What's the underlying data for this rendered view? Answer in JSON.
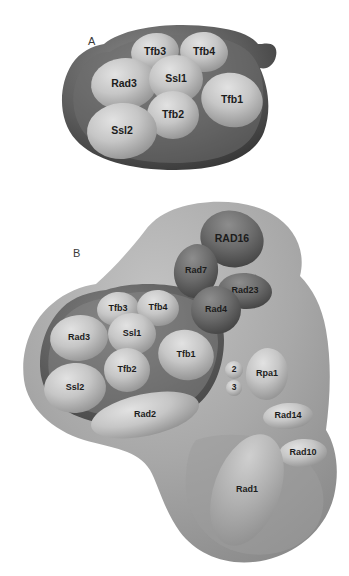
{
  "figure": {
    "background_color": "#ffffff",
    "panels": [
      {
        "id": "A",
        "label": "A",
        "label_x": 88,
        "label_y": 41,
        "envelope": {
          "name": "tfiih-core-envelope",
          "fill_light": "#b9b9b9",
          "fill_dark": "#4a4a4a",
          "rim_color": "#2e2e2e"
        },
        "subunits": [
          {
            "id": "tfb3",
            "label": "Tfb3",
            "cx": 155,
            "cy": 52,
            "rx": 24,
            "ry": 19,
            "rot": -8,
            "tone": "light",
            "size": "normal"
          },
          {
            "id": "tfb4",
            "label": "Tfb4",
            "cx": 204,
            "cy": 52,
            "rx": 24,
            "ry": 20,
            "rot": 6,
            "tone": "light",
            "size": "normal"
          },
          {
            "id": "rad3",
            "label": "Rad3",
            "cx": 124,
            "cy": 84,
            "rx": 33,
            "ry": 26,
            "rot": -6,
            "tone": "light",
            "size": "normal"
          },
          {
            "id": "ssl1",
            "label": "Ssl1",
            "cx": 176,
            "cy": 79,
            "rx": 27,
            "ry": 24,
            "rot": 0,
            "tone": "light",
            "size": "normal"
          },
          {
            "id": "tfb1",
            "label": "Tfb1",
            "cx": 232,
            "cy": 100,
            "rx": 31,
            "ry": 27,
            "rot": 16,
            "tone": "light",
            "size": "normal"
          },
          {
            "id": "tfb2",
            "label": "Tfb2",
            "cx": 173,
            "cy": 115,
            "rx": 26,
            "ry": 24,
            "rot": 0,
            "tone": "light",
            "size": "normal"
          },
          {
            "id": "ssl2",
            "label": "Ssl2",
            "cx": 122,
            "cy": 131,
            "rx": 35,
            "ry": 28,
            "rot": -4,
            "tone": "light",
            "size": "normal"
          }
        ]
      },
      {
        "id": "B",
        "label": "B",
        "label_x": 73,
        "label_y": 253,
        "envelope": {
          "name": "repairosome-envelope",
          "fill_light": "#b2b2b2",
          "fill_mid": "#9e9e9e",
          "fill_dark": "#5a5a5a",
          "rim_color": "#8e8e8e"
        },
        "subunits": [
          {
            "id": "rad16",
            "label": "RAD16",
            "cx": 232,
            "cy": 239,
            "rx": 32,
            "ry": 28,
            "rot": 18,
            "tone": "dark",
            "size": "normal"
          },
          {
            "id": "rad7",
            "label": "Rad7",
            "cx": 196,
            "cy": 271,
            "rx": 22,
            "ry": 27,
            "rot": 8,
            "tone": "dark",
            "size": "small"
          },
          {
            "id": "rad23",
            "label": "Rad23",
            "cx": 245,
            "cy": 291,
            "rx": 27,
            "ry": 18,
            "rot": 4,
            "tone": "dark",
            "size": "small"
          },
          {
            "id": "rad4",
            "label": "Rad4",
            "cx": 216,
            "cy": 310,
            "rx": 25,
            "ry": 24,
            "rot": 0,
            "tone": "dark",
            "size": "small"
          },
          {
            "id": "tfb3",
            "label": "Tfb3",
            "cx": 118,
            "cy": 309,
            "rx": 21,
            "ry": 17,
            "rot": -6,
            "tone": "light",
            "size": "small"
          },
          {
            "id": "tfb4",
            "label": "Tfb4",
            "cx": 158,
            "cy": 308,
            "rx": 21,
            "ry": 18,
            "rot": 5,
            "tone": "light",
            "size": "small"
          },
          {
            "id": "rad3",
            "label": "Rad3",
            "cx": 79,
            "cy": 338,
            "rx": 29,
            "ry": 23,
            "rot": -6,
            "tone": "light",
            "size": "small"
          },
          {
            "id": "ssl1",
            "label": "Ssl1",
            "cx": 132,
            "cy": 334,
            "rx": 24,
            "ry": 21,
            "rot": 0,
            "tone": "light",
            "size": "small"
          },
          {
            "id": "tfb1",
            "label": "Tfb1",
            "cx": 186,
            "cy": 355,
            "rx": 28,
            "ry": 25,
            "rot": 14,
            "tone": "light",
            "size": "small"
          },
          {
            "id": "tfb2",
            "label": "Tfb2",
            "cx": 127,
            "cy": 370,
            "rx": 23,
            "ry": 22,
            "rot": 0,
            "tone": "light",
            "size": "small"
          },
          {
            "id": "ssl2",
            "label": "Ssl2",
            "cx": 75,
            "cy": 388,
            "rx": 31,
            "ry": 25,
            "rot": -4,
            "tone": "light",
            "size": "small"
          },
          {
            "id": "rpa2",
            "label": "2",
            "cx": 234,
            "cy": 370,
            "rx": 9,
            "ry": 9,
            "rot": 0,
            "tone": "light",
            "size": "tiny"
          },
          {
            "id": "rpa3",
            "label": "3",
            "cx": 234,
            "cy": 388,
            "rx": 8,
            "ry": 8,
            "rot": 0,
            "tone": "light",
            "size": "tiny"
          },
          {
            "id": "rpa1",
            "label": "Rpa1",
            "cx": 267,
            "cy": 374,
            "rx": 21,
            "ry": 26,
            "rot": 6,
            "tone": "light",
            "size": "small"
          },
          {
            "id": "rad2",
            "label": "Rad2",
            "cx": 145,
            "cy": 415,
            "rx": 55,
            "ry": 21,
            "rot": -12,
            "tone": "light",
            "size": "small"
          },
          {
            "id": "rad14",
            "label": "Rad14",
            "cx": 288,
            "cy": 416,
            "rx": 25,
            "ry": 13,
            "rot": -4,
            "tone": "light",
            "size": "small"
          },
          {
            "id": "rad10",
            "label": "Rad10",
            "cx": 303,
            "cy": 453,
            "rx": 24,
            "ry": 14,
            "rot": -4,
            "tone": "light",
            "size": "small"
          },
          {
            "id": "rad1",
            "label": "Rad1",
            "cx": 247,
            "cy": 490,
            "rx": 33,
            "ry": 58,
            "rot": 20,
            "tone": "light",
            "size": "small"
          }
        ]
      }
    ]
  }
}
